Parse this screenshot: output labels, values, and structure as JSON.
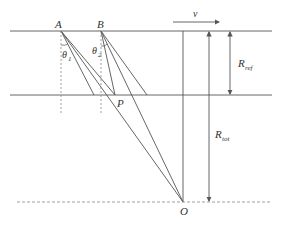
{
  "diagram": {
    "labels": {
      "A": "A",
      "B": "B",
      "P": "P",
      "O": "O",
      "theta1_main": "θ",
      "theta1_sub": "1",
      "theta2_main": "θ",
      "theta2_sub": "2",
      "v": "v",
      "R_ref_main": "R",
      "R_ref_sub": "ref",
      "R_tot_main": "R",
      "R_tot_sub": "tot"
    },
    "colors": {
      "line": "#555555",
      "dashed": "#888888",
      "text": "#333333"
    }
  }
}
